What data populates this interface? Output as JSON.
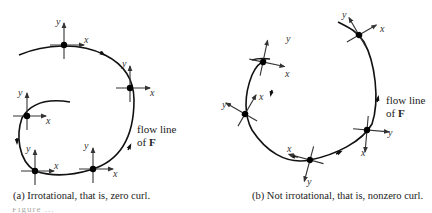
{
  "figure": {
    "panel_a": {
      "caption": "(a) Irrotational, that is, zero curl.",
      "flow_label_line1": "flow line",
      "flow_label_line2_prefix": "of ",
      "flow_label_vector": "F",
      "axis_x_label": "x",
      "axis_y_label": "y",
      "frames": [
        {
          "id": "top",
          "cx": 64,
          "cy": 45
        },
        {
          "id": "right",
          "cx": 130,
          "cy": 88
        },
        {
          "id": "left",
          "cx": 27,
          "cy": 116
        },
        {
          "id": "bottom-left",
          "cx": 35,
          "cy": 171
        },
        {
          "id": "bottom-right",
          "cx": 93,
          "cy": 169
        }
      ],
      "frame_orientation": "fixed (axes remain parallel along flow line)"
    },
    "panel_b": {
      "caption": "(b) Not irrotational, that is, nonzero curl.",
      "flow_label_line1": "flow line",
      "flow_label_line2_prefix": "of ",
      "flow_label_vector": "F",
      "axis_x_label": "x",
      "axis_y_label": "y",
      "frames": [
        {
          "id": "top",
          "cx": 359,
          "cy": 35
        },
        {
          "id": "upper-left",
          "cx": 263,
          "cy": 62
        },
        {
          "id": "left",
          "cx": 245,
          "cy": 114
        },
        {
          "id": "bottom",
          "cx": 310,
          "cy": 160
        },
        {
          "id": "right",
          "cx": 367,
          "cy": 130
        }
      ],
      "frame_orientation": "rotating (axes rotate along flow line)"
    },
    "truncated_caption_hint": "Figure ..."
  }
}
